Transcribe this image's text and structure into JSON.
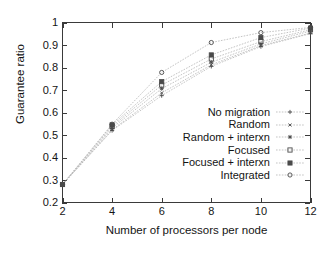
{
  "chart_data": {
    "type": "line",
    "title": "",
    "xlabel": "Number of processors per node",
    "ylabel": "Guarantee ratio",
    "x": [
      2,
      4,
      6,
      8,
      10,
      12
    ],
    "xlim": [
      2,
      12
    ],
    "ylim": [
      0.2,
      1.0
    ],
    "xticks": [
      "2",
      "4",
      "6",
      "8",
      "10",
      "12"
    ],
    "yticks": [
      "0.2",
      "0.3",
      "0.4",
      "0.5",
      "0.6",
      "0.7",
      "0.8",
      "0.9",
      "1"
    ],
    "grid": false,
    "legend_position": "center-right-inside",
    "series": [
      {
        "name": "No migration",
        "marker": "plus",
        "values": [
          0.28,
          0.52,
          0.675,
          0.805,
          0.893,
          0.951
        ]
      },
      {
        "name": "Random",
        "marker": "cross",
        "values": [
          0.28,
          0.523,
          0.687,
          0.812,
          0.897,
          0.953
        ]
      },
      {
        "name": "Random + interxn",
        "marker": "star",
        "values": [
          0.28,
          0.531,
          0.706,
          0.823,
          0.905,
          0.962
        ]
      },
      {
        "name": "Focused",
        "marker": "open-square",
        "values": [
          0.28,
          0.538,
          0.722,
          0.838,
          0.915,
          0.968
        ]
      },
      {
        "name": "Focused + interxn",
        "marker": "filled-square",
        "values": [
          0.28,
          0.545,
          0.737,
          0.856,
          0.933,
          0.975
        ]
      },
      {
        "name": "Integrated",
        "marker": "open-circle",
        "values": [
          0.28,
          0.548,
          0.778,
          0.911,
          0.955,
          0.978
        ]
      }
    ]
  },
  "axes": {
    "xlabel": "Number of processors per node",
    "ylabel": "Guarantee ratio",
    "yticks": [
      {
        "label": "1",
        "value": 1.0
      },
      {
        "label": "0.9",
        "value": 0.9
      },
      {
        "label": "0.8",
        "value": 0.8
      },
      {
        "label": "0.7",
        "value": 0.7
      },
      {
        "label": "0.6",
        "value": 0.6
      },
      {
        "label": "0.5",
        "value": 0.5
      },
      {
        "label": "0.4",
        "value": 0.4
      },
      {
        "label": "0.3",
        "value": 0.3
      },
      {
        "label": "0.2",
        "value": 0.2
      }
    ],
    "xticks": [
      {
        "label": "2",
        "value": 2
      },
      {
        "label": "4",
        "value": 4
      },
      {
        "label": "6",
        "value": 6
      },
      {
        "label": "8",
        "value": 8
      },
      {
        "label": "10",
        "value": 10
      },
      {
        "label": "12",
        "value": 12
      }
    ]
  },
  "legend": {
    "items": [
      {
        "label": "No migration"
      },
      {
        "label": "Random"
      },
      {
        "label": "Random + interxn"
      },
      {
        "label": "Focused"
      },
      {
        "label": "Focused + interxn"
      },
      {
        "label": "Integrated"
      }
    ]
  },
  "colors": {
    "line": "#b9b9b9",
    "marker": "#4a4a4a",
    "axis": "#3a3a3a",
    "text": "#141414"
  }
}
